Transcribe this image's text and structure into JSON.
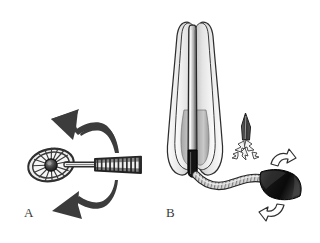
{
  "figure": {
    "background_color": "#ffffff",
    "width": 320,
    "height": 243
  },
  "panels": [
    {
      "id": "a",
      "label": "A",
      "caption": "A",
      "subject": "cytology-brush",
      "elements": [
        {
          "name": "brush-head",
          "description": "oval radial-spoked brush head",
          "color": "#4a4a4a"
        },
        {
          "name": "brush-hub",
          "description": "dark central hub",
          "color": "#2b2b2b"
        },
        {
          "name": "brush-shaft",
          "description": "straight thin shaft",
          "color": "#3c3c3c"
        },
        {
          "name": "coiled-sheath",
          "description": "ribbed coiled outer sheath",
          "color": "#3a3a3a"
        },
        {
          "name": "rotation-arrow-upper",
          "description": "curved arrow pointing upper-left",
          "color": "#3c3c3c"
        },
        {
          "name": "rotation-arrow-lower",
          "description": "curved arrow pointing lower-left",
          "color": "#3c3c3c"
        }
      ]
    },
    {
      "id": "b",
      "label": "B",
      "caption": "B",
      "subject": "sheathed-endoscope-probe",
      "elements": [
        {
          "name": "outer-sheath-petals",
          "description": "nested elongated teardrop sheath leaves",
          "color": "#d8d8d8"
        },
        {
          "name": "central-probe-tube",
          "description": "long central tube with gradient shading",
          "color": "#9a9a9a"
        },
        {
          "name": "probe-tip-dark",
          "description": "dark distal tube tip",
          "color": "#1e1e1e"
        },
        {
          "name": "flexible-cable",
          "description": "coiled flexible connecting cable",
          "color": "#b5b5b5"
        },
        {
          "name": "handle-cone",
          "description": "dark conical handle / connector",
          "color": "#121212"
        },
        {
          "name": "needle-blade",
          "description": "narrow blade / needle pointing upward",
          "color": "#3a3a3a"
        },
        {
          "name": "spray-burst-arrows",
          "description": "small outlined burst arrows below blade",
          "color": "#5a5a5a"
        },
        {
          "name": "handle-arrow-upper",
          "description": "white outlined curved arrow above handle",
          "color": "#ffffff"
        },
        {
          "name": "handle-arrow-lower",
          "description": "white outlined curved arrow below handle",
          "color": "#ffffff"
        }
      ]
    }
  ],
  "colors": {
    "ink_dark": "#2b2b2b",
    "ink_mid": "#4a4a4a",
    "ink_light": "#9a9a9a",
    "fill_pale": "#e8e8e8",
    "background": "#ffffff",
    "label_text": "#3a3a3a"
  }
}
